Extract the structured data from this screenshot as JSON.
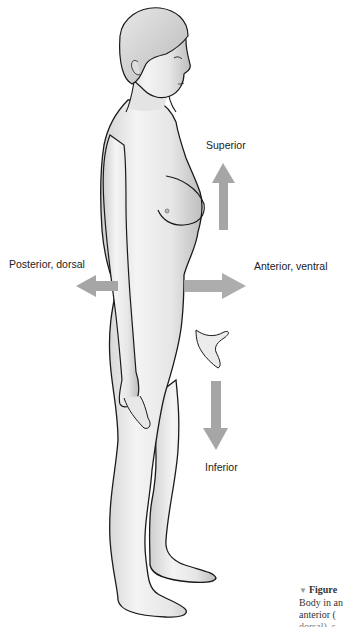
{
  "diagram": {
    "arrow_color": "#a6a6a6",
    "labels": {
      "superior": "Superior",
      "inferior": "Inferior",
      "posterior": "Posterior, dorsal",
      "anterior": "Anterior, ventral"
    }
  },
  "caption": {
    "marker": "▼",
    "figure_label": "Figure",
    "line1": "Body in an",
    "line2": "anterior (",
    "line3": "dorsal), s"
  }
}
